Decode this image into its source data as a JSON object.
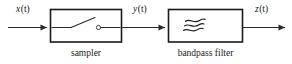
{
  "diagram": {
    "background_color": "#ffffff",
    "line_color": "#2b2b2b",
    "text_color": "#1a1a1a",
    "signals": [
      {
        "id": "input",
        "label_var": "x",
        "label_arg": "(t)",
        "label_full": "x(t)"
      },
      {
        "id": "intermediate",
        "label_var": "y",
        "label_arg": "(t)",
        "label_full": "y(t)"
      },
      {
        "id": "output",
        "label_var": "z",
        "label_arg": "(t)",
        "label_full": "z(t)"
      }
    ],
    "blocks": [
      {
        "id": "sampler",
        "caption": "sampler",
        "symbol": "open-switch-icon"
      },
      {
        "id": "bandpass-filter",
        "caption": "bandpass filter",
        "symbol": "triple-wave-icon"
      }
    ]
  }
}
